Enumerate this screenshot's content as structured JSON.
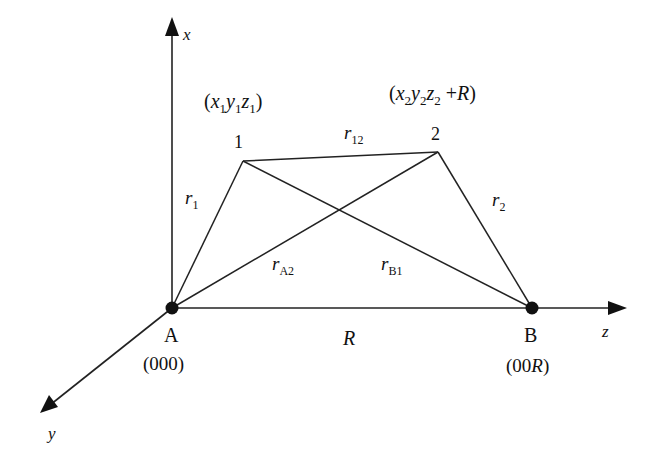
{
  "diagram": {
    "type": "coordinate-geometry",
    "axes": {
      "x": {
        "label": "x"
      },
      "y": {
        "label": "y"
      },
      "z": {
        "label": "z"
      }
    },
    "nuclei": {
      "A": {
        "label": "A",
        "coords_text": "(000)"
      },
      "B": {
        "label": "B",
        "coords_text": "(00R)",
        "coords_prefix": "(00",
        "coords_var": "R",
        "coords_suffix": ")"
      }
    },
    "electrons": {
      "e1": {
        "label": "1",
        "coords": {
          "open": "(",
          "x": "x",
          "x_sub": "1",
          "y": "y",
          "y_sub": "1",
          "z": "z",
          "z_sub": "1",
          "close": ")"
        }
      },
      "e2": {
        "label": "2",
        "coords": {
          "open": "(",
          "x": "x",
          "x_sub": "2",
          "y": "y",
          "y_sub": "2",
          "z": "z",
          "z_sub": "2",
          "plus": " +",
          "var": "R",
          "close": ")"
        }
      }
    },
    "distances": {
      "r1": {
        "sym": "r",
        "sub": "1"
      },
      "r2": {
        "sym": "r",
        "sub": "2"
      },
      "r12": {
        "sym": "r",
        "sub": "12"
      },
      "rA2": {
        "sym": "r",
        "sub": "A2"
      },
      "rB1": {
        "sym": "r",
        "sub": "B1"
      },
      "R": {
        "sym": "R"
      }
    },
    "colors": {
      "line": "#222222",
      "text": "#111111",
      "background": "#ffffff"
    }
  }
}
